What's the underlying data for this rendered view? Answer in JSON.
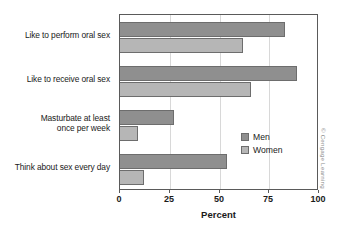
{
  "chart_data": {
    "type": "bar",
    "orientation": "horizontal",
    "title": "",
    "xlabel": "Percent",
    "ylabel": "",
    "xlim": [
      0,
      100
    ],
    "xticks": [
      0,
      25,
      50,
      75,
      100
    ],
    "xtick_labels": [
      "0",
      "25",
      "50",
      "75",
      "100"
    ],
    "grid": true,
    "legend_position": "inside-lower-right",
    "categories": [
      "Like to perform oral sex",
      "Like to receive oral sex",
      "Masturbate at least once per week",
      "Think about sex every day"
    ],
    "category_lines": [
      [
        "Like to perform oral sex"
      ],
      [
        "Like to receive oral sex"
      ],
      [
        "Masturbate at least",
        "once per week"
      ],
      [
        "Think about sex every day"
      ]
    ],
    "series": [
      {
        "name": "Men",
        "color": "#8f8f8f",
        "values": [
          83,
          89,
          27,
          54
        ]
      },
      {
        "name": "Women",
        "color": "#b6b6b6",
        "values": [
          62,
          66,
          9,
          12
        ]
      }
    ]
  },
  "legend": {
    "items": [
      {
        "label": "Men"
      },
      {
        "label": "Women"
      }
    ]
  },
  "attribution": "© Cengage Learning",
  "colors": {
    "men": "#8f8f8f",
    "women": "#b6b6b6",
    "axis": "#5a5a5a",
    "grid": "#d8d8d8",
    "text": "#1a1a1a"
  }
}
